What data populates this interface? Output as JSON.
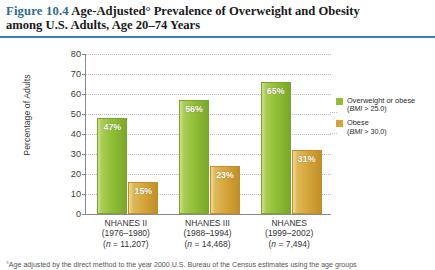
{
  "figure": {
    "number": "Figure 10.4",
    "title": "Age-Adjusted° Prevalence of Overweight and Obesity among U.S. Adults, Age 20–74 Years",
    "title_line1_number": "Figure 10.4",
    "title_line1_text": "Age-Adjusted° Prevalence of Overweight and Obesity",
    "title_line2_text": "among U.S. Adults, Age 20–74 Years",
    "rule_color": "#3d80aa",
    "number_color": "#2e6b92"
  },
  "footnote": "°Age adjusted by the direct method to the year 2000 U.S. Bureau of the Census estimates using the age groups",
  "legend": {
    "items": [
      {
        "label": "Overweight or obese",
        "sublabel": "(BMI > 25.0)",
        "color": "#8fbe36",
        "swatch_name": "legend-swatch-overweight"
      },
      {
        "label": "Obese",
        "sublabel": "(BMI > 30.0)",
        "color": "#d4a43a",
        "swatch_name": "legend-swatch-obese"
      }
    ]
  },
  "chart_data": {
    "type": "bar",
    "title": "Age-Adjusted° Prevalence of Overweight and Obesity among U.S. Adults, Age 20–74 Years",
    "xlabel": "",
    "ylabel": "Percentage of Adults",
    "ylim": [
      0,
      80
    ],
    "yticks": [
      0,
      10,
      20,
      30,
      40,
      50,
      60,
      70,
      80
    ],
    "ytick_labels": [
      "0",
      "10",
      "20",
      "30",
      "40",
      "50",
      "60",
      "70",
      "80"
    ],
    "grid": "horizontal-dotted",
    "legend_position": "right",
    "categories": [
      "NHANES II",
      "NHANES III",
      "NHANES"
    ],
    "category_details": [
      {
        "name": "NHANES II",
        "years": "(1976–1980)",
        "n_label": "(n = 11,207)",
        "n_prefix": "(",
        "n_italic": "n",
        "n_suffix": " = 11,207)"
      },
      {
        "name": "NHANES III",
        "years": "(1988–1994)",
        "n_label": "(n = 14,468)",
        "n_prefix": "(",
        "n_italic": "n",
        "n_suffix": " = 14,468)"
      },
      {
        "name": "NHANES",
        "years": "(1999–2002)",
        "n_label": "(n = 7,494)",
        "n_prefix": "(",
        "n_italic": "n",
        "n_suffix": " = 7,494)"
      }
    ],
    "series": [
      {
        "name": "Overweight or obese (BMI > 25.0)",
        "color": "#8fbe36",
        "values": [
          47,
          56,
          65
        ],
        "value_labels": [
          "47%",
          "56%",
          "65%"
        ]
      },
      {
        "name": "Obese (BMI > 30.0)",
        "color": "#d4a43a",
        "values": [
          15,
          23,
          31
        ],
        "value_labels": [
          "15%",
          "23%",
          "31%"
        ]
      }
    ]
  }
}
